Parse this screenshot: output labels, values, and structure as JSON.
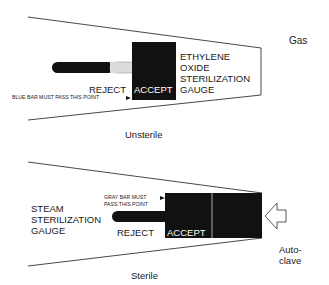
{
  "gas_panel": {
    "side_label": "Gas",
    "gauge_title_lines": [
      "ETHYLENE",
      "OXIDE",
      "STERILIZATION",
      "GAUGE"
    ],
    "reject_label": "REJECT",
    "accept_label": "ACCEPT",
    "pass_note": "BLUE BAR MUST PASS THIS POINT",
    "caption": "Unsterile"
  },
  "steam_panel": {
    "side_label_lines": [
      "Auto-",
      "clave"
    ],
    "gauge_title_lines": [
      "STEAM",
      "STERILIZATION",
      "GAUGE"
    ],
    "reject_label": "REJECT",
    "accept_label": "ACCEPT",
    "pass_note_lines": [
      "GRAY BAR MUST",
      "PASS THIS POINT"
    ],
    "caption": "Sterile"
  },
  "colors": {
    "ink": "#111111",
    "bar_light": "#dcdcdc",
    "line": "#333333"
  }
}
